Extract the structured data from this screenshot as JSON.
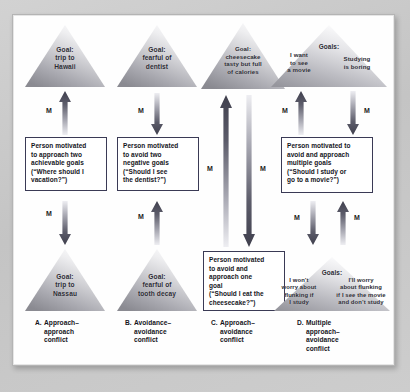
{
  "figure": {
    "motivation_symbol": "M",
    "colors": {
      "backdrop": "#c9c9c9",
      "panel": "#fefefe",
      "box_border": "#3a3a55",
      "text": "#15151c",
      "triangle_light": "#f2f2f2",
      "triangle_dark": "#8d8d93",
      "arrow_dark": "#4a4a58",
      "arrow_light": "#e9e9ee"
    }
  },
  "columns": [
    {
      "id": "A",
      "caption_letter": "A.",
      "caption_lines": [
        "Approach–",
        "approach",
        "conflict"
      ],
      "top_triangle": {
        "lines": [
          "Goal:",
          "trip to",
          "Hawaii"
        ]
      },
      "bottom_triangle": {
        "lines": [
          "Goal:",
          "trip to",
          "Nassau"
        ]
      },
      "box_lines": [
        "Person motivated",
        "to approach two",
        "achievable goals",
        "(“Where should I",
        "vacation?”)"
      ],
      "arrows": [
        {
          "name": "arrow-up-to-top-goal",
          "direction": "up",
          "label": "M"
        },
        {
          "name": "arrow-down-to-bottom-goal",
          "direction": "down",
          "label": "M"
        }
      ]
    },
    {
      "id": "B",
      "caption_letter": "B.",
      "caption_lines": [
        "Avoidance–",
        "avoidance",
        "conflict"
      ],
      "top_triangle": {
        "lines": [
          "Goal:",
          "fearful of",
          "dentist"
        ]
      },
      "bottom_triangle": {
        "lines": [
          "Goal:",
          "fearful of",
          "tooth decay"
        ]
      },
      "box_lines": [
        "Person motivated",
        "to avoid two",
        "negative goals",
        "(“Should I see",
        "the dentist?”)"
      ],
      "arrows": [
        {
          "name": "arrow-down-from-top-goal",
          "direction": "down",
          "label": "M"
        },
        {
          "name": "arrow-up-from-bottom-goal",
          "direction": "up",
          "label": "M"
        }
      ]
    },
    {
      "id": "C",
      "caption_letter": "C.",
      "caption_lines": [
        "Approach–",
        "avoidance",
        "conflict"
      ],
      "top_triangle": {
        "lines": [
          "Goal:",
          "cheesecake",
          "tasty but full",
          "of calories"
        ]
      },
      "bottom_triangle": null,
      "box_lines": [
        "Person motivated",
        "to avoid and",
        "approach one",
        "goal",
        "(“Should I eat the",
        "cheesecake?”)"
      ],
      "arrows": [
        {
          "name": "arrow-up-to-goal",
          "direction": "up",
          "label": "M"
        },
        {
          "name": "arrow-down-to-box",
          "direction": "down",
          "label": "M"
        }
      ]
    },
    {
      "id": "D",
      "caption_letter": "D.",
      "caption_lines": [
        "Multiple",
        "approach–",
        "avoidance",
        "conflict"
      ],
      "top_triangle": {
        "heading": "Goals:",
        "left_lines": [
          "I want",
          "to see",
          "a movie"
        ],
        "right_lines": [
          "Studying",
          "is boring"
        ]
      },
      "bottom_triangle": {
        "heading": "Goals:",
        "left_lines": [
          "I won’t",
          "worry about",
          "flunking if",
          "I study"
        ],
        "right_lines": [
          "I’ll worry",
          "about flunking",
          "if I see the movie",
          "and don’t study"
        ]
      },
      "box_lines": [
        "Person motivated to",
        "avoid and approach",
        "multiple goals",
        "(“Should I study or",
        "go to a movie?”)"
      ],
      "arrows": [
        {
          "name": "arrow-up-to-top-goals",
          "direction": "up",
          "label": "M"
        },
        {
          "name": "arrow-down-from-top-goals",
          "direction": "down",
          "label": "M"
        },
        {
          "name": "arrow-down-to-bottom-goals",
          "direction": "down",
          "label": "M"
        },
        {
          "name": "arrow-up-from-bottom-goals",
          "direction": "up",
          "label": "M"
        }
      ]
    }
  ]
}
